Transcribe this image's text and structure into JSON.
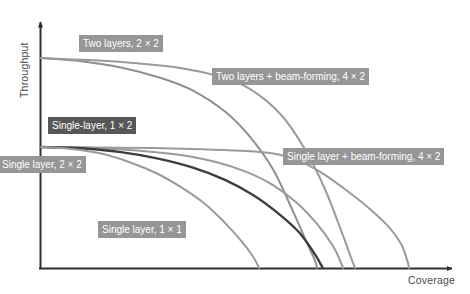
{
  "chart_data": {
    "type": "line",
    "title": "",
    "xlabel": "Coverage",
    "ylabel": "Throughput",
    "grid": false,
    "legend_position": "inline-annotations",
    "axis_note": "Qualitative axes with no numeric tick labels; x = Coverage increasing right, y = Throughput increasing up.",
    "xlim": [
      0,
      1
    ],
    "ylim": [
      0,
      1
    ],
    "series": [
      {
        "name": "Two layers, 2 × 2",
        "color": "#8f8f8f",
        "start_throughput": 1.0,
        "end_coverage": 0.69,
        "x": [
          0.0,
          0.1,
          0.2,
          0.3,
          0.38,
          0.46,
          0.52,
          0.58,
          0.63,
          0.66,
          0.685,
          0.69
        ],
        "y": [
          1.0,
          0.985,
          0.955,
          0.905,
          0.845,
          0.745,
          0.63,
          0.47,
          0.27,
          0.14,
          0.035,
          0.0
        ]
      },
      {
        "name": "Two layers + beam-forming, 4 × 2",
        "color": "#9a9a9a",
        "start_throughput": 1.0,
        "end_coverage": 0.785,
        "x": [
          0.0,
          0.12,
          0.24,
          0.34,
          0.44,
          0.52,
          0.6,
          0.66,
          0.71,
          0.75,
          0.775,
          0.785
        ],
        "y": [
          1.0,
          0.99,
          0.975,
          0.955,
          0.915,
          0.855,
          0.73,
          0.565,
          0.375,
          0.18,
          0.05,
          0.0
        ]
      },
      {
        "name": "Single layer + beam-forming, 4 × 2",
        "color": "#9a9a9a",
        "start_throughput": 0.576,
        "end_coverage": 0.92,
        "x": [
          0.0,
          0.14,
          0.28,
          0.4,
          0.5,
          0.58,
          0.64,
          0.7,
          0.76,
          0.82,
          0.87,
          0.9,
          0.915,
          0.92
        ],
        "y": [
          0.576,
          0.574,
          0.571,
          0.566,
          0.558,
          0.545,
          0.515,
          0.455,
          0.375,
          0.285,
          0.195,
          0.115,
          0.04,
          0.0
        ]
      },
      {
        "name": "Single-layer, 1 × 2",
        "color": "#9a9a9a",
        "start_throughput": 0.576,
        "end_coverage": 0.755,
        "x": [
          0.0,
          0.12,
          0.24,
          0.34,
          0.43,
          0.51,
          0.58,
          0.64,
          0.69,
          0.73,
          0.75,
          0.755
        ],
        "y": [
          0.576,
          0.572,
          0.56,
          0.54,
          0.508,
          0.46,
          0.395,
          0.31,
          0.21,
          0.105,
          0.025,
          0.0
        ]
      },
      {
        "name": "Single layer, 2 × 2",
        "color": "#3d3d3d",
        "start_throughput": 0.576,
        "end_coverage": 0.705,
        "x": [
          0.0,
          0.1,
          0.2,
          0.29,
          0.38,
          0.46,
          0.53,
          0.59,
          0.645,
          0.685,
          0.7,
          0.705
        ],
        "y": [
          0.576,
          0.57,
          0.552,
          0.522,
          0.478,
          0.42,
          0.348,
          0.265,
          0.17,
          0.065,
          0.015,
          0.0
        ]
      },
      {
        "name": "Single layer, 1 × 1",
        "color": "#9a9a9a",
        "start_throughput": 0.576,
        "end_coverage": 0.545,
        "x": [
          0.0,
          0.07,
          0.15,
          0.22,
          0.29,
          0.35,
          0.41,
          0.46,
          0.5,
          0.53,
          0.542,
          0.545
        ],
        "y": [
          0.576,
          0.568,
          0.545,
          0.505,
          0.45,
          0.385,
          0.305,
          0.215,
          0.13,
          0.055,
          0.012,
          0.0
        ]
      }
    ],
    "annotations": [
      {
        "text": "Two layers, 2 × 2",
        "style": "light"
      },
      {
        "text": "Two layers + beam-forming, 4 × 2",
        "style": "light"
      },
      {
        "text": "Single-layer, 1 × 2",
        "style": "dark"
      },
      {
        "text": "Single layer + beam-forming, 4 × 2",
        "style": "light"
      },
      {
        "text": "Single layer, 2 × 2",
        "style": "light"
      },
      {
        "text": "Single layer, 1 × 1",
        "style": "light"
      }
    ]
  },
  "axes": {
    "x_title": "Coverage",
    "y_title": "Throughput"
  },
  "labels": {
    "two_layers_2x2": "Two layers, 2 × 2",
    "two_layers_bf_4x2": "Two layers + beam-forming, 4 × 2",
    "single_layer_1x2": "Single-layer, 1 × 2",
    "single_layer_bf_4x2": "Single layer + beam-forming, 4 × 2",
    "single_layer_2x2": "Single layer, 2 × 2",
    "single_layer_1x1": "Single layer, 1 × 1"
  }
}
